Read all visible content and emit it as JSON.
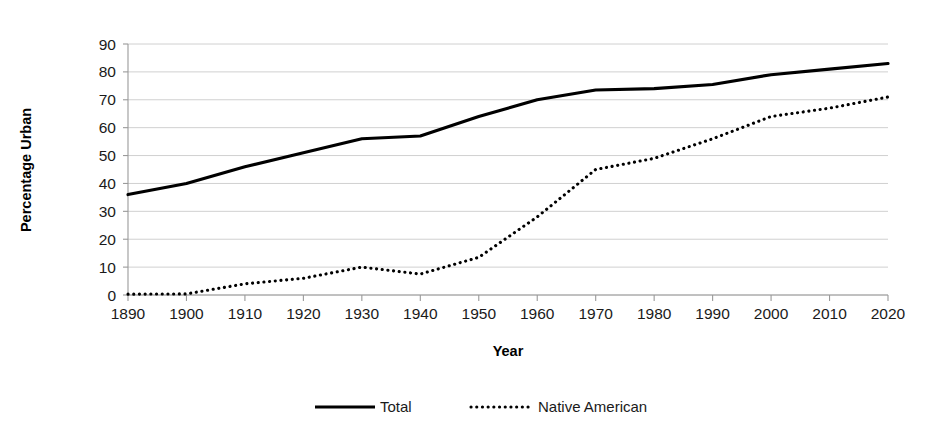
{
  "chart_data": {
    "type": "line",
    "title": "",
    "xlabel": "Year",
    "ylabel": "Percentage Urban",
    "x": [
      1890,
      1900,
      1910,
      1920,
      1930,
      1940,
      1950,
      1960,
      1970,
      1980,
      1990,
      2000,
      2010,
      2020
    ],
    "xtick_labels": [
      "1890",
      "1900",
      "1910",
      "1920",
      "1930",
      "1940",
      "1950",
      "1960",
      "1970",
      "1980",
      "1990",
      "2000",
      "2010",
      "2020"
    ],
    "ytick_labels": [
      "0",
      "10",
      "20",
      "30",
      "40",
      "50",
      "60",
      "70",
      "80",
      "90"
    ],
    "yticks": [
      0,
      10,
      20,
      30,
      40,
      50,
      60,
      70,
      80,
      90
    ],
    "ylim": [
      0,
      90
    ],
    "xlim": [
      1890,
      2020
    ],
    "grid": "horizontal",
    "legend_position": "bottom",
    "series": [
      {
        "name": "Total",
        "style": "solid",
        "color": "#000000",
        "values": [
          36,
          40,
          46,
          51,
          56,
          57,
          64,
          70,
          73.5,
          74,
          75.5,
          79,
          81,
          83
        ]
      },
      {
        "name": "Native American",
        "style": "dotted",
        "color": "#000000",
        "values": [
          0.3,
          0.4,
          4,
          6,
          10,
          7.5,
          13.5,
          28,
          45,
          49,
          56,
          64,
          67,
          71
        ]
      }
    ]
  },
  "legend": {
    "items": [
      {
        "label": "Total"
      },
      {
        "label": "Native American"
      }
    ]
  }
}
